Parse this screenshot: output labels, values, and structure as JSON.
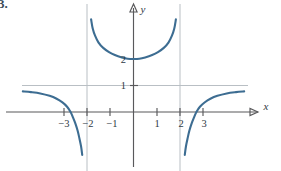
{
  "problem": {
    "number": "3."
  },
  "chart_data": {
    "type": "line",
    "title": "",
    "xlabel": "x",
    "ylabel": "y",
    "xlim": [
      -4.8,
      4.9
    ],
    "ylim": [
      -1.6,
      3.5
    ],
    "grid": false,
    "legend": null,
    "x_ticks": [
      -3,
      -2,
      -1,
      1,
      2,
      3
    ],
    "x_tick_labels": [
      "−3",
      "−2",
      "−1",
      "1",
      "2",
      "3"
    ],
    "y_ticks": [
      1,
      2
    ],
    "y_tick_labels": [
      "1",
      "2"
    ],
    "annotations": {
      "vertical_asymptotes": [
        -2,
        2
      ],
      "horizontal_asymptote": 1,
      "local_minimum": [
        0,
        2
      ],
      "x_intercepts": [
        -2.85,
        2.85
      ]
    },
    "series": [
      {
        "name": "left-branch",
        "comment": "approaches y=1 from below on the far left, falls to -infinity as x -> -2 from the left",
        "points": [
          [
            -4.75,
            0.78
          ],
          [
            -4.4,
            0.75
          ],
          [
            -4.0,
            0.7
          ],
          [
            -3.6,
            0.61
          ],
          [
            -3.3,
            0.5
          ],
          [
            -3.05,
            0.36
          ],
          [
            -2.85,
            0.2
          ],
          [
            -2.7,
            0.0
          ],
          [
            -2.6,
            -0.2
          ],
          [
            -2.5,
            -0.42
          ],
          [
            -2.4,
            -0.7
          ],
          [
            -2.32,
            -1.0
          ],
          [
            -2.25,
            -1.3
          ],
          [
            -2.2,
            -1.62
          ]
        ]
      },
      {
        "name": "middle-branch",
        "comment": "U shaped, minimum at (0,2), rises to +infinity near x = -2 and x = 2",
        "points": [
          [
            -1.82,
            3.5
          ],
          [
            -1.75,
            3.15
          ],
          [
            -1.65,
            2.88
          ],
          [
            -1.5,
            2.62
          ],
          [
            -1.3,
            2.42
          ],
          [
            -1.05,
            2.26
          ],
          [
            -0.8,
            2.15
          ],
          [
            -0.5,
            2.06
          ],
          [
            -0.25,
            2.01
          ],
          [
            0.0,
            2.0
          ],
          [
            0.25,
            2.01
          ],
          [
            0.5,
            2.06
          ],
          [
            0.8,
            2.15
          ],
          [
            1.05,
            2.26
          ],
          [
            1.3,
            2.42
          ],
          [
            1.5,
            2.62
          ],
          [
            1.65,
            2.88
          ],
          [
            1.75,
            3.15
          ],
          [
            1.82,
            3.5
          ]
        ]
      },
      {
        "name": "right-branch",
        "comment": "rises from -infinity just right of x=2, crosses x-axis near 2.85, approaches y=1 from below",
        "points": [
          [
            2.2,
            -1.62
          ],
          [
            2.25,
            -1.3
          ],
          [
            2.32,
            -1.0
          ],
          [
            2.4,
            -0.7
          ],
          [
            2.5,
            -0.42
          ],
          [
            2.6,
            -0.2
          ],
          [
            2.7,
            0.0
          ],
          [
            2.85,
            0.2
          ],
          [
            3.05,
            0.36
          ],
          [
            3.3,
            0.5
          ],
          [
            3.6,
            0.61
          ],
          [
            4.0,
            0.7
          ],
          [
            4.4,
            0.75
          ],
          [
            4.75,
            0.78
          ]
        ]
      }
    ]
  }
}
